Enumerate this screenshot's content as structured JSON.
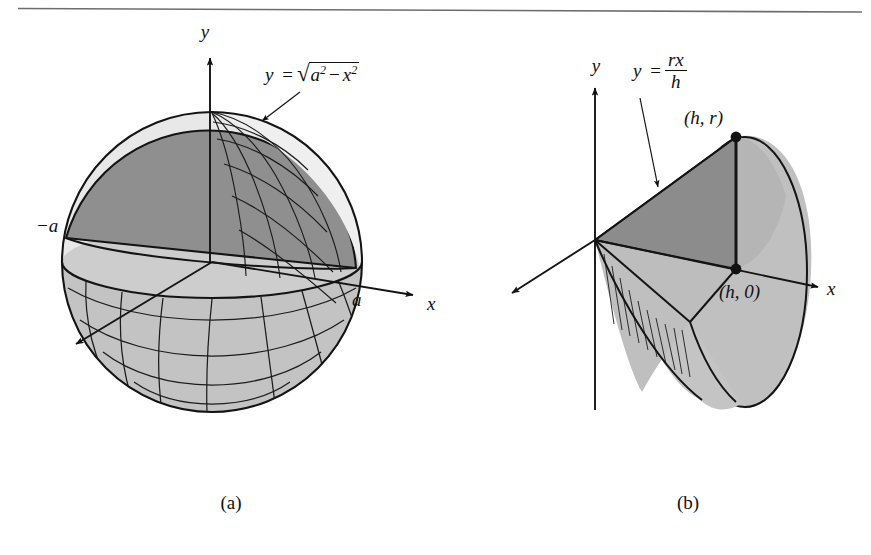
{
  "figure": {
    "top_rule": true,
    "background_color": "#ffffff",
    "ink_color": "#111111",
    "shade_dark": "#8f8f8f",
    "shade_mid": "#b0b0b0",
    "shade_light": "#c9c9c9",
    "shade_pale": "#e2e2e2"
  },
  "panel_a": {
    "caption": "(a)",
    "axis_y_label": "y",
    "axis_x_label": "x",
    "tick_left_label": "−a",
    "tick_right_label": "a",
    "curve_equation": {
      "lhs": "y",
      "equals": "=",
      "radical_symbol": "√",
      "radicand_first_base": "a",
      "radicand_first_exp": "2",
      "radicand_minus": "−",
      "radicand_second_base": "x",
      "radicand_second_exp": "2",
      "plain": "y = √(a² − x²)"
    },
    "object": "sphere-of-radius-a-with-upper-half-disk-cross-section"
  },
  "panel_b": {
    "caption": "(b)",
    "axis_y_label": "y",
    "axis_x_label": "x",
    "line_equation": {
      "lhs": "y",
      "equals": "=",
      "numerator": "rx",
      "denominator": "h",
      "plain": "y = rx/h"
    },
    "point_top_label": "(h, r)",
    "point_base_label": "(h, 0)",
    "object": "cone-of-height-h-and-radius-r-with-triangular-cross-section"
  }
}
